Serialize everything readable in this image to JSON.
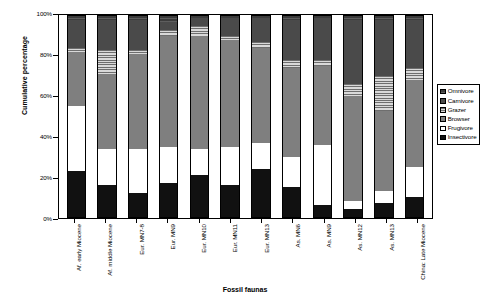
{
  "chart_data": {
    "type": "bar",
    "subtype": "stacked-bar-100-percent",
    "title": "",
    "xlabel": "Fossil faunas",
    "ylabel": "Cumulative percentage",
    "ylim": [
      0,
      100
    ],
    "yticks": [
      "0%",
      "20%",
      "40%",
      "60%",
      "80%",
      "100%"
    ],
    "ytick_values": [
      0,
      20,
      40,
      60,
      80,
      100
    ],
    "grid": false,
    "legend_position": "right",
    "stack_order_bottom_to_top": [
      "Insectivore",
      "Frugivore",
      "Browser",
      "Grazer",
      "Carnivore",
      "Omnivore"
    ],
    "categories": [
      "Af. early Miocene",
      "Af. middle Miocene",
      "Eur. MN7-8",
      "Eur. MN9",
      "Eur. MN10",
      "Eur. MN11",
      "Eur. MN13",
      "As. MN6",
      "As. MN9",
      "As. MN12",
      "As. MN13",
      "China: Late Miocene"
    ],
    "series": [
      {
        "name": "Insectivore",
        "fill": "solid-black",
        "color": "#111111",
        "values": [
          23,
          16,
          12,
          17,
          21,
          16,
          24,
          15,
          6,
          4,
          7,
          10
        ]
      },
      {
        "name": "Frugivore",
        "fill": "open-white",
        "color": "#ffffff",
        "values": [
          32,
          18,
          22,
          18,
          13,
          19,
          13,
          15,
          30,
          4,
          6,
          15
        ]
      },
      {
        "name": "Browser",
        "fill": "solid-gray",
        "color": "#7f7f7f",
        "values": [
          27,
          37,
          47,
          55,
          56,
          53,
          47,
          44,
          39,
          52,
          40,
          43
        ]
      },
      {
        "name": "Grazer",
        "fill": "horizontal-stripes",
        "color": "#6e6e6e",
        "values": [
          2,
          12,
          2,
          3,
          5,
          2,
          3,
          4,
          3,
          6,
          17,
          6
        ]
      },
      {
        "name": "Carnivore",
        "fill": "dark-gray",
        "color": "#4a4a4a",
        "values": [
          14,
          15,
          15,
          4,
          4,
          9,
          12,
          20,
          21,
          32,
          28,
          24
        ]
      },
      {
        "name": "Omnivore",
        "fill": "dark-checked",
        "color": "#3c3c3c",
        "values": [
          2,
          2,
          2,
          3,
          1,
          1,
          1,
          2,
          1,
          2,
          2,
          2
        ]
      }
    ],
    "legend_entries": [
      {
        "label": "Omnivore",
        "swatch": "dark-checked"
      },
      {
        "label": "Carnivore",
        "swatch": "dark-gray"
      },
      {
        "label": "Grazer",
        "swatch": "horizontal-stripes"
      },
      {
        "label": "Browser",
        "swatch": "solid-gray"
      },
      {
        "label": "Frugivore",
        "swatch": "open-white"
      },
      {
        "label": "Insectivore",
        "swatch": "solid-black"
      }
    ]
  }
}
